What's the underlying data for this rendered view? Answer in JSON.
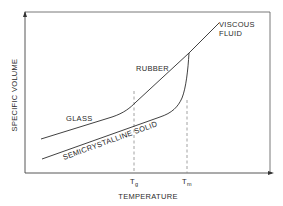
{
  "diagram": {
    "type": "specific-volume-vs-temperature",
    "axes": {
      "y_label": "SPECIFIC VOLUME",
      "x_label": "TEMPERATURE",
      "x_ticks": [
        {
          "main": "T",
          "sub": "g"
        },
        {
          "main": "T",
          "sub": "m"
        }
      ]
    },
    "regions": {
      "glass": "GLASS",
      "rubber": "RUBBER",
      "viscous_fluid_line1": "VISCOUS",
      "viscous_fluid_line2": "FLUID",
      "semicrystalline": "SEMICRYSTALLINE  SOLID"
    },
    "colors": {
      "line": "#2b2b2b",
      "dashed": "#8a8a8a",
      "background": "#ffffff"
    }
  }
}
